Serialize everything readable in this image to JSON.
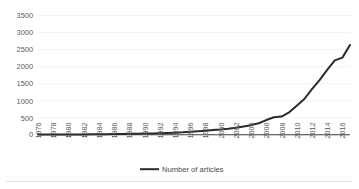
{
  "chart_data": {
    "type": "line",
    "title": "",
    "subtitle": "",
    "xlabel": "",
    "ylabel": "",
    "ylim": [
      0,
      3500
    ],
    "ytick_labels": [
      "0",
      "500",
      "1000",
      "1500",
      "2000",
      "2500",
      "3000",
      "3500"
    ],
    "ytick_values": [
      0,
      500,
      1000,
      1500,
      2000,
      2500,
      3000,
      3500
    ],
    "xtick_labels": [
      "1976",
      "1978",
      "1980",
      "1982",
      "1984",
      "1986",
      "1988",
      "1990",
      "1992",
      "1994",
      "1996",
      "1998",
      "2000",
      "2002",
      "2004",
      "2006",
      "2008",
      "2010",
      "2012",
      "2014",
      "2016"
    ],
    "grid": true,
    "legend_position": "bottom",
    "legend": [
      "Number of articles"
    ],
    "series": [
      {
        "name": "Number of articles",
        "color": "#2b2b2d",
        "x": [
          1976,
          1977,
          1978,
          1979,
          1980,
          1981,
          1982,
          1983,
          1984,
          1985,
          1986,
          1987,
          1988,
          1989,
          1990,
          1991,
          1992,
          1993,
          1994,
          1995,
          1996,
          1997,
          1998,
          1999,
          2000,
          2001,
          2002,
          2003,
          2004,
          2005,
          2006,
          2007,
          2008,
          2009,
          2010,
          2011,
          2012,
          2013,
          2014,
          2015,
          2016,
          2017
        ],
        "values": [
          5,
          6,
          7,
          8,
          9,
          10,
          12,
          14,
          16,
          18,
          21,
          24,
          28,
          32,
          36,
          40,
          45,
          52,
          60,
          70,
          85,
          100,
          118,
          135,
          150,
          170,
          200,
          235,
          275,
          330,
          420,
          500,
          520,
          640,
          830,
          1020,
          1300,
          1560,
          1850,
          2120,
          2200,
          2560
        ]
      }
    ]
  },
  "legend": {
    "marker": "line-swatch",
    "label": "Number of articles"
  },
  "axes": {
    "y_axis_name": "value-axis",
    "x_axis_name": "year-axis"
  }
}
